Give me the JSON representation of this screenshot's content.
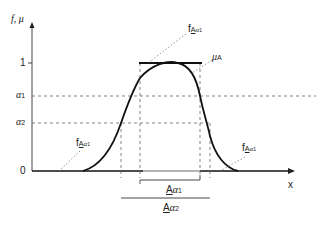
{
  "diagram": {
    "y_axis_label": "f, μ",
    "x_axis_label": "x",
    "y_ticks": {
      "one": "1",
      "alpha1": "α",
      "alpha1_sub": "1",
      "alpha2": "α",
      "alpha2_sub": "2",
      "zero": "0"
    },
    "membership_label": {
      "mu": "μ",
      "sub": "A"
    },
    "f_label": {
      "f": "f",
      "A": "A",
      "alpha": "α",
      "sub": "1"
    },
    "cut_labels": [
      {
        "A": "A",
        "alpha": "α",
        "sub": "1"
      },
      {
        "A": "A",
        "alpha": "α",
        "sub": "2"
      }
    ],
    "colors": {
      "ink": "#111111",
      "dash": "#555555",
      "background": "#ffffff"
    }
  }
}
